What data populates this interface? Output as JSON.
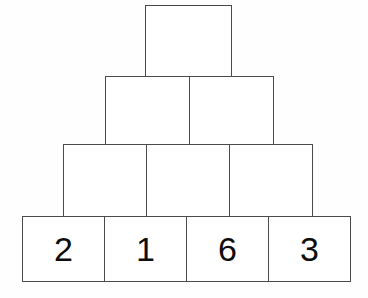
{
  "diagram": {
    "shape": "pyramid",
    "background_color": "#fefefe",
    "stroke_color": "#4a4a4a",
    "fill_color": "#ffffff",
    "text_color": "#0d0d0d",
    "rows": [
      {
        "name": "row-top",
        "level": 1,
        "cell_count": 1,
        "cells": [
          {
            "value": "",
            "filled": false
          }
        ]
      },
      {
        "name": "row-second",
        "level": 2,
        "cell_count": 2,
        "cells": [
          {
            "value": "",
            "filled": false
          },
          {
            "value": "",
            "filled": false
          }
        ]
      },
      {
        "name": "row-third",
        "level": 3,
        "cell_count": 3,
        "cells": [
          {
            "value": "",
            "filled": false
          },
          {
            "value": "",
            "filled": false
          },
          {
            "value": "",
            "filled": false
          }
        ]
      },
      {
        "name": "row-base",
        "level": 4,
        "cell_count": 4,
        "cells": [
          {
            "value": "2",
            "filled": true
          },
          {
            "value": "1",
            "filled": true
          },
          {
            "value": "6",
            "filled": true
          },
          {
            "value": "3",
            "filled": true
          }
        ]
      }
    ]
  }
}
